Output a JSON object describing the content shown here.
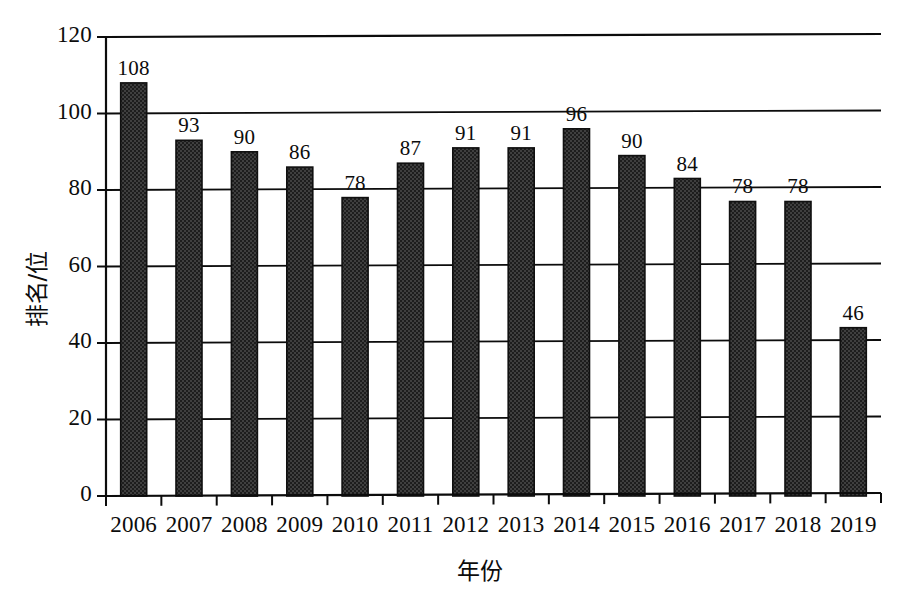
{
  "chart_data": {
    "type": "bar",
    "title": "",
    "subtitle": "",
    "xlabel": "年份",
    "ylabel": "排名/位",
    "categories": [
      "2006",
      "2007",
      "2008",
      "2009",
      "2010",
      "2011",
      "2012",
      "2013",
      "2014",
      "2015",
      "2016",
      "2017",
      "2018",
      "2019"
    ],
    "values": [
      108,
      93,
      90,
      86,
      78,
      87,
      91,
      91,
      96,
      90,
      84,
      78,
      78,
      46
    ],
    "data_labels": [
      "108",
      "93",
      "90",
      "86",
      "78",
      "87",
      "91",
      "91",
      "96",
      "90",
      "84",
      "78",
      "78",
      "46"
    ],
    "bar_plotted_heights": [
      108,
      93,
      90,
      86,
      78,
      87,
      91,
      91,
      96,
      89,
      83,
      77,
      77,
      44
    ],
    "ylim": [
      0,
      120
    ],
    "xlim_note": "categorical",
    "yticks": [
      0,
      20,
      40,
      60,
      80,
      100,
      120
    ],
    "ytick_labels": [
      "0",
      "20",
      "40",
      "60",
      "80",
      "100",
      "120"
    ],
    "grid": "horizontal",
    "legend": null,
    "legend_position": "none",
    "bar_color": "#3c3c3c",
    "bar_edge_color": "#101010",
    "bar_fill_style": "dark-dithered-checker",
    "axis_color": "#0c0c0c",
    "background_color": "#ffffff"
  },
  "axes": {
    "y_axis_title": "排名/位",
    "x_axis_title": "年份"
  }
}
